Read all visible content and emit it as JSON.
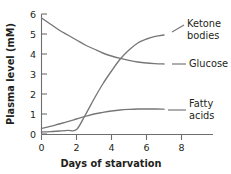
{
  "chart_data": {
    "type": "line",
    "title": "",
    "xlabel": "Days of starvation",
    "ylabel": "Plasma level (mM)",
    "xlim": [
      0,
      8
    ],
    "ylim": [
      0,
      6
    ],
    "xticks": [
      "0",
      "2",
      "4",
      "6",
      "8"
    ],
    "xtick_values": [
      0,
      2,
      4,
      6,
      8
    ],
    "yticks": [
      "0",
      "1",
      "2",
      "3",
      "4",
      "5",
      "6"
    ],
    "ytick_values": [
      0,
      1,
      2,
      3,
      4,
      5,
      6
    ],
    "grid": false,
    "legend_position": "right-inline-labels",
    "line_color": "#77777a",
    "axis_color": "#6e6e6e",
    "background": "#ffffff",
    "series": [
      {
        "name": "Glucose",
        "label_line1": "Glucose",
        "label_line2": "",
        "x": [
          0,
          0.5,
          1,
          1.5,
          2,
          2.5,
          3,
          3.5,
          4,
          4.5,
          5,
          5.5,
          6,
          6.5,
          7
        ],
        "values": [
          5.8,
          5.5,
          5.2,
          4.95,
          4.7,
          4.45,
          4.25,
          4.05,
          3.9,
          3.78,
          3.68,
          3.6,
          3.55,
          3.52,
          3.5
        ]
      },
      {
        "name": "Ketone bodies",
        "label_line1": "Ketone",
        "label_line2": "bodies",
        "x": [
          0,
          0.5,
          1,
          1.5,
          2,
          2.5,
          3,
          3.5,
          4,
          4.5,
          5,
          5.5,
          6,
          6.5,
          7
        ],
        "values": [
          0.1,
          0.12,
          0.15,
          0.18,
          0.22,
          0.95,
          1.75,
          2.5,
          3.15,
          3.75,
          4.2,
          4.55,
          4.75,
          4.88,
          4.95
        ]
      },
      {
        "name": "Fatty acids",
        "label_line1": "Fatty",
        "label_line2": "acids",
        "x": [
          0,
          0.5,
          1,
          1.5,
          2,
          2.5,
          3,
          3.5,
          4,
          4.5,
          5,
          5.5,
          6,
          6.5,
          7
        ],
        "values": [
          0.28,
          0.38,
          0.5,
          0.62,
          0.75,
          0.88,
          1.0,
          1.08,
          1.15,
          1.2,
          1.23,
          1.25,
          1.25,
          1.25,
          1.24
        ]
      }
    ]
  }
}
